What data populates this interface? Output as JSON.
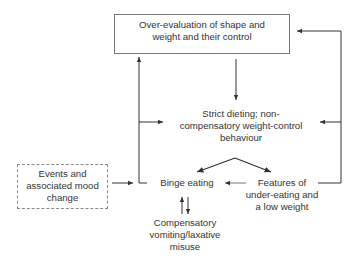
{
  "diagram": {
    "nodes": {
      "overevaluation": {
        "line1": "Over-evaluation of shape and",
        "line2": "weight and their control"
      },
      "strict_dieting": {
        "line1": "Strict dieting; non-",
        "line2": "compensatory weight-control",
        "line3": "behaviour"
      },
      "binge_eating": {
        "label": "Binge eating"
      },
      "events_mood": {
        "line1": "Events and",
        "line2": "associated mood",
        "line3": "change"
      },
      "underweight": {
        "line1": "Features of",
        "line2": "under-eating and",
        "line3": "a low weight"
      },
      "compensatory": {
        "line1": "Compensatory",
        "line2": "vomiting/laxative",
        "line3": "misuse"
      }
    },
    "edges": [
      {
        "from": "overevaluation",
        "to": "strict_dieting"
      },
      {
        "from": "overevaluation",
        "to": "binge_eating",
        "note": "via left loop line"
      },
      {
        "from": "strict_dieting",
        "to": "binge_eating"
      },
      {
        "from": "strict_dieting",
        "to": "underweight"
      },
      {
        "from": "underweight",
        "to": "binge_eating"
      },
      {
        "from": "underweight",
        "to": "overevaluation"
      },
      {
        "from": "underweight",
        "to": "strict_dieting"
      },
      {
        "from": "events_mood",
        "to": "binge_eating"
      },
      {
        "from": "binge_eating",
        "to": "compensatory"
      },
      {
        "from": "compensatory",
        "to": "binge_eating"
      }
    ],
    "colors": {
      "line": "#333333",
      "box_border": "#777777",
      "text": "#333333"
    }
  }
}
